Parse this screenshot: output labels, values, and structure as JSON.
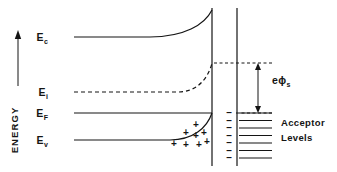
{
  "figure": {
    "background_color": "#ffffff",
    "line_color": "#141414"
  },
  "axis": {
    "label": "ENERGY",
    "arrow_direction": "up",
    "arrow": {
      "x": 18,
      "y_top": 30,
      "y_bottom": 86
    },
    "label_position": {
      "x": 18,
      "y": 130
    }
  },
  "band_labels": [
    {
      "id": "Ec",
      "base": "E",
      "sub": "c",
      "x": 48,
      "y": 41
    },
    {
      "id": "Ei",
      "base": "E",
      "sub": "i",
      "x": 48,
      "y": 96
    },
    {
      "id": "EF",
      "base": "E",
      "sub": "F",
      "x": 48,
      "y": 117
    },
    {
      "id": "Ev",
      "base": "E",
      "sub": "v",
      "x": 48,
      "y": 144
    }
  ],
  "bands": {
    "conduction": {
      "name": "conduction-band-edge",
      "style": "solid",
      "flat_y": 37,
      "x_start": 74,
      "x_bend": 150,
      "x_end": 212,
      "y_end": 10
    },
    "intrinsic": {
      "name": "intrinsic-fermi-level",
      "style": "dashed",
      "flat_y": 92,
      "x_start": 74,
      "x_bend": 178,
      "x_end": 212,
      "y_end": 63,
      "dash_pattern": "4,3"
    },
    "fermi": {
      "name": "fermi-level",
      "style": "solid",
      "flat_y": 113,
      "x_start": 74,
      "x_end": 212
    },
    "valence": {
      "name": "valence-band-edge",
      "style": "solid",
      "flat_y": 140,
      "x_start": 74,
      "x_bend": 170,
      "x_end": 212,
      "y_end": 113
    }
  },
  "interface": {
    "name": "oxide-layer",
    "left_line_x": 212,
    "right_line_x": 237,
    "y_top": 8,
    "y_bottom": 166
  },
  "band_bending": {
    "label_base": "e",
    "label_phi": "ϕ",
    "label_sub": "s",
    "label_x": 272,
    "label_y": 84,
    "arrow_x": 258,
    "y_top": 63,
    "y_bottom": 113,
    "guide_top": {
      "x1": 214,
      "x2": 272,
      "y": 63
    },
    "guide_bottom": {
      "x1": 236,
      "x2": 272,
      "y": 113
    },
    "dash_pattern": "3,2.5"
  },
  "acceptor_levels": {
    "label_line1": "Acceptor",
    "label_line2": "Levels",
    "label_x": 281,
    "label_y1": 126,
    "label_y2": 141,
    "tick_x_start": 239,
    "tick_x_end": 272,
    "minus_x": 229,
    "count": 7,
    "y_start": 113,
    "y_step": 7.5
  },
  "space_charge": {
    "symbol": "+",
    "positions": [
      {
        "x": 196,
        "y": 128
      },
      {
        "x": 186,
        "y": 136
      },
      {
        "x": 196,
        "y": 139
      },
      {
        "x": 204,
        "y": 136
      },
      {
        "x": 174,
        "y": 147
      },
      {
        "x": 186,
        "y": 148
      },
      {
        "x": 199,
        "y": 148
      },
      {
        "x": 207,
        "y": 145
      }
    ]
  }
}
